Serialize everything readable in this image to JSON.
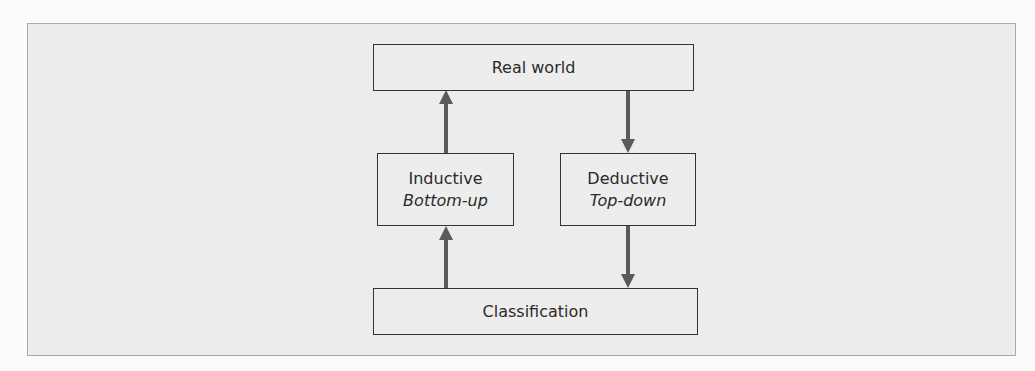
{
  "diagram": {
    "top": {
      "label": "Real world"
    },
    "left": {
      "label": "Inductive",
      "sublabel": "Bottom-up"
    },
    "right": {
      "label": "Deductive",
      "sublabel": "Top-down"
    },
    "bottom": {
      "label": "Classification"
    },
    "arrow_color": "#5a5a5a"
  }
}
